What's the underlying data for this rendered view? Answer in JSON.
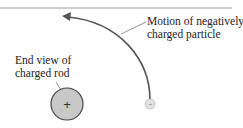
{
  "labels": {
    "motion_line1": "Motion of negatively",
    "motion_line2": "charged particle",
    "rod_line1": "End view of",
    "rod_line2": "charged rod"
  },
  "rod": {
    "symbol": "+",
    "charge": "positive"
  },
  "particle": {
    "symbol": "−",
    "charge": "negative"
  },
  "colors": {
    "rod_fill": "#c8c8c8",
    "rod_stroke": "#444444",
    "particle_fill": "#e2e2e2",
    "path_stroke": "#555555",
    "rule": "#999999"
  }
}
